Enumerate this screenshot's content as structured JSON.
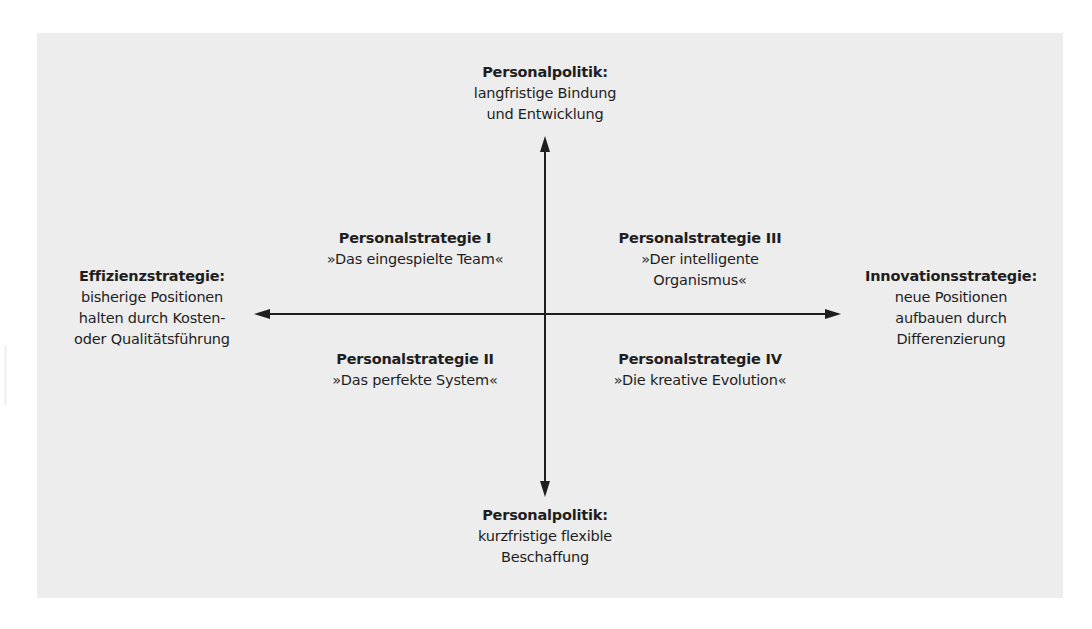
{
  "diagram": {
    "type": "quadrant-matrix",
    "colors": {
      "background": "#ffffff",
      "panel": "#ededed",
      "axis": "#1e1e1e",
      "text": "#1e1e1e"
    },
    "axes": {
      "top": {
        "title": "Personalpolitik:",
        "lines": [
          "langfristige Bindung",
          "und Entwicklung"
        ]
      },
      "bottom": {
        "title": "Personalpolitik:",
        "lines": [
          "kurzfristige flexible",
          "Beschaffung"
        ]
      },
      "left": {
        "title": "Effizienzstrategie:",
        "lines": [
          "bisherige Positionen",
          "halten durch Kosten-",
          "oder Qualitätsführung"
        ]
      },
      "right": {
        "title": "Innovationsstrategie:",
        "lines": [
          "neue Positionen",
          "aufbauen durch",
          "Differenzierung"
        ]
      }
    },
    "quadrants": {
      "top_left": {
        "title": "Personalstrategie I",
        "lines": [
          "»Das eingespielte Team«"
        ]
      },
      "top_right": {
        "title": "Personalstrategie III",
        "lines": [
          "»Der intelligente",
          "Organismus«"
        ]
      },
      "bottom_left": {
        "title": "Personalstrategie II",
        "lines": [
          "»Das perfekte System«"
        ]
      },
      "bottom_right": {
        "title": "Personalstrategie IV",
        "lines": [
          "»Die kreative Evolution«"
        ]
      }
    }
  }
}
